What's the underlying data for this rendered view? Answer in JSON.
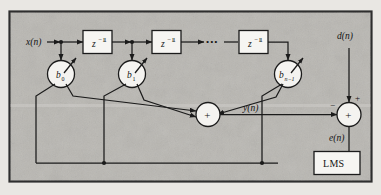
{
  "figure": {
    "frame": {
      "border_color": "#3a3a3a",
      "background_color": "#b9b7b2"
    },
    "signals": {
      "input": "x(n)",
      "desired": "d(n)",
      "output": "y(n)",
      "error": "e(n)"
    },
    "delay_blocks": [
      {
        "label_base": "z",
        "label_exponent": "−1"
      },
      {
        "label_base": "z",
        "label_exponent": "−1"
      },
      {
        "label_base": "z",
        "label_exponent": "−1"
      }
    ],
    "ellipsis": "•••",
    "coefficients": [
      {
        "base": "b",
        "subscript": "0"
      },
      {
        "base": "b",
        "subscript": "1"
      },
      {
        "base": "b",
        "subscript": "n−1"
      }
    ],
    "adders": [
      {
        "name": "output-summer",
        "symbol": "+"
      },
      {
        "name": "error-summer",
        "symbol": "+"
      }
    ],
    "error_summer_signs": {
      "desired_sign": "+",
      "output_sign": "−"
    },
    "lms_block": {
      "label": "LMS"
    }
  }
}
